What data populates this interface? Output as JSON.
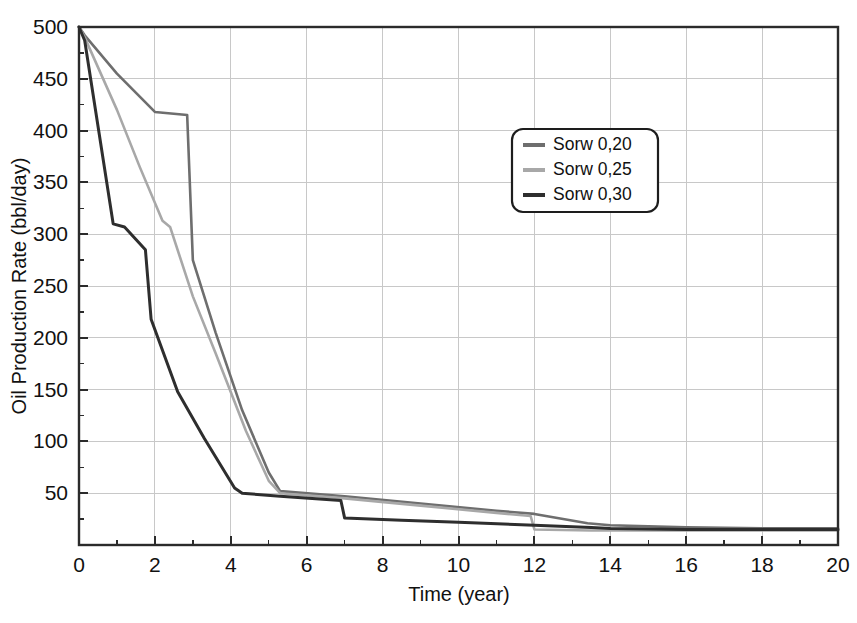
{
  "chart_data": {
    "type": "line",
    "title": "",
    "xlabel": "Time (year)",
    "ylabel": "Oil Production Rate (bbl/day)",
    "xlim": [
      0,
      20
    ],
    "ylim": [
      0,
      500
    ],
    "grid": true,
    "legend_position": "upper-center-right",
    "x_ticks": [
      0,
      2,
      4,
      6,
      8,
      10,
      12,
      14,
      16,
      18,
      20
    ],
    "x_tick_labels": [
      "0",
      "2",
      "4",
      "6",
      "8",
      "10",
      "12",
      "14",
      "16",
      "18",
      "20"
    ],
    "x_minor_ticks": [
      1,
      3,
      5,
      7,
      9,
      11,
      13,
      15,
      17,
      19
    ],
    "y_ticks": [
      50,
      100,
      150,
      200,
      250,
      300,
      350,
      400,
      450,
      500
    ],
    "y_tick_labels": [
      "50",
      "100",
      "150",
      "200",
      "250",
      "300",
      "350",
      "400",
      "450",
      "500"
    ],
    "y_minor_ticks": [
      25,
      75,
      125,
      175,
      225,
      275,
      325,
      375,
      425,
      475
    ],
    "series": [
      {
        "name": "Sorw 0,20",
        "color": "#6e6e6e",
        "x": [
          0.0,
          0.15,
          1.0,
          2.0,
          2.85,
          3.0,
          3.6,
          4.3,
          5.0,
          5.3,
          7.0,
          9.0,
          11.0,
          12.0,
          13.4,
          14.0,
          16.0,
          18.0,
          20.0
        ],
        "y": [
          500,
          492,
          455,
          418,
          415,
          275,
          205,
          130,
          70,
          52,
          47,
          40,
          33,
          30,
          21,
          19,
          17,
          16,
          16
        ]
      },
      {
        "name": "Sorw 0,25",
        "color": "#a8a8a8",
        "x": [
          0.0,
          0.15,
          1.0,
          1.6,
          2.2,
          2.4,
          3.0,
          3.6,
          4.4,
          5.0,
          5.3,
          7.0,
          9.0,
          11.0,
          11.9,
          12.0,
          13.5,
          14.0,
          16.0,
          18.0,
          20.0
        ],
        "y": [
          500,
          490,
          420,
          365,
          313,
          307,
          240,
          185,
          110,
          62,
          50,
          45,
          38,
          31,
          28,
          15,
          14,
          14,
          14,
          14,
          14
        ]
      },
      {
        "name": "Sorw 0,30",
        "color": "#2e2e2e",
        "x": [
          0.0,
          0.15,
          0.9,
          1.2,
          1.75,
          1.9,
          2.6,
          3.3,
          4.1,
          4.3,
          5.3,
          6.9,
          7.0,
          8.5,
          10.0,
          12.0,
          13.5,
          14.0,
          16.0,
          18.0,
          20.0
        ],
        "y": [
          500,
          487,
          310,
          307,
          285,
          218,
          148,
          103,
          55,
          50,
          47,
          43,
          26,
          24,
          22,
          19,
          17,
          16,
          15,
          15,
          15
        ]
      }
    ]
  },
  "legend": {
    "entries": [
      {
        "label": "Sorw 0,20"
      },
      {
        "label": "Sorw 0,25"
      },
      {
        "label": "Sorw 0,30"
      }
    ]
  }
}
